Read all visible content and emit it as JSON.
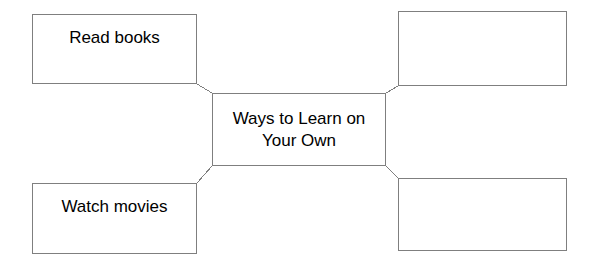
{
  "diagram": {
    "title": "Ways to Learn on Your Own",
    "type": "spider-web-graphic-organizer",
    "center": {
      "id": "center",
      "label": "Ways to Learn on\nYour Own",
      "filled": true
    },
    "branches": [
      {
        "id": "top-left",
        "position": "top-left",
        "label": "Read books",
        "filled": true
      },
      {
        "id": "top-right",
        "position": "top-right",
        "label": "",
        "filled": false
      },
      {
        "id": "bottom-left",
        "position": "bottom-left",
        "label": "Watch movies",
        "filled": true
      },
      {
        "id": "bottom-right",
        "position": "bottom-right",
        "label": "",
        "filled": false
      }
    ],
    "connectors": [
      {
        "id": "connector-top-left",
        "from": "top-left",
        "to": "center"
      },
      {
        "id": "connector-top-right",
        "from": "top-right",
        "to": "center"
      },
      {
        "id": "connector-bottom-left",
        "from": "bottom-left",
        "to": "center"
      },
      {
        "id": "connector-bottom-right",
        "from": "bottom-right",
        "to": "center"
      }
    ],
    "colors": {
      "stroke": "#7f7f7f",
      "text": "#000000",
      "background": "#ffffff"
    }
  }
}
